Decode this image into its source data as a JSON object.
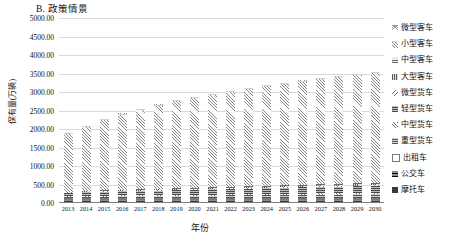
{
  "chart_data": {
    "type": "bar",
    "subtype": "stacked-bar",
    "title": "B. 政策情景",
    "xlabel": "年份",
    "ylabel": "保有量(万辆)",
    "ylim": [
      0,
      5000
    ],
    "ytick_labels": [
      "5000.00",
      "4500.00",
      "4000.00",
      "3500.00",
      "3000.00",
      "2500.00",
      "2000.00",
      "1500.00",
      "1000.00",
      "500.00",
      "0.00"
    ],
    "ytick_values": [
      5000,
      4500,
      4000,
      3500,
      3000,
      2500,
      2000,
      1500,
      1000,
      500,
      0
    ],
    "grid": true,
    "legend_position": "right",
    "categories": [
      "2013",
      "2014",
      "2015",
      "2016",
      "2017",
      "2018",
      "2019",
      "2020",
      "2021",
      "2022",
      "2023",
      "2024",
      "2025",
      "2026",
      "2027",
      "2028",
      "2029",
      "2030"
    ],
    "series": [
      {
        "name": "摩托车",
        "pattern": "p-moto",
        "values": [
          60,
          60,
          60,
          60,
          58,
          58,
          56,
          56,
          54,
          54,
          52,
          52,
          50,
          50,
          48,
          48,
          46,
          46
        ]
      },
      {
        "name": "公交车",
        "pattern": "p-bus",
        "values": [
          12,
          13,
          14,
          15,
          16,
          17,
          18,
          19,
          20,
          21,
          22,
          23,
          24,
          25,
          26,
          27,
          28,
          29
        ]
      },
      {
        "name": "出租车",
        "pattern": "p-taxi",
        "values": [
          8,
          8,
          9,
          9,
          10,
          10,
          11,
          11,
          12,
          12,
          13,
          13,
          14,
          14,
          15,
          15,
          16,
          16
        ]
      },
      {
        "name": "重型货车",
        "pattern": "p-heavy",
        "values": [
          40,
          44,
          48,
          52,
          56,
          60,
          64,
          68,
          72,
          76,
          80,
          84,
          88,
          92,
          96,
          100,
          104,
          108
        ]
      },
      {
        "name": "中型货车",
        "pattern": "p-medium",
        "values": [
          22,
          23,
          24,
          25,
          26,
          27,
          28,
          29,
          30,
          31,
          32,
          33,
          34,
          35,
          36,
          37,
          38,
          39
        ]
      },
      {
        "name": "轻型货车",
        "pattern": "p-light",
        "values": [
          90,
          96,
          102,
          108,
          114,
          120,
          126,
          132,
          138,
          144,
          150,
          156,
          162,
          168,
          174,
          180,
          186,
          192
        ]
      },
      {
        "name": "微型货车",
        "pattern": "p-mini-truck",
        "values": [
          10,
          10,
          11,
          11,
          12,
          12,
          13,
          13,
          14,
          14,
          15,
          15,
          16,
          16,
          17,
          17,
          18,
          18
        ]
      },
      {
        "name": "大型客车",
        "pattern": "p-large-bus",
        "values": [
          14,
          15,
          16,
          17,
          18,
          19,
          20,
          21,
          22,
          23,
          24,
          25,
          26,
          27,
          28,
          29,
          30,
          31
        ]
      },
      {
        "name": "中型客车",
        "pattern": "p-med-bus",
        "values": [
          10,
          11,
          12,
          13,
          14,
          15,
          16,
          17,
          18,
          19,
          20,
          21,
          22,
          23,
          24,
          25,
          26,
          27
        ]
      },
      {
        "name": "小型客车",
        "pattern": "p-small-bus",
        "values": [
          1580,
          1760,
          1930,
          2060,
          2180,
          2280,
          2380,
          2460,
          2530,
          2600,
          2660,
          2720,
          2770,
          2820,
          2870,
          2910,
          2950,
          2990
        ]
      },
      {
        "name": "微型客车",
        "pattern": "p-mini-bus",
        "values": [
          6,
          6,
          6,
          6,
          6,
          6,
          6,
          6,
          6,
          6,
          6,
          6,
          6,
          6,
          6,
          6,
          6,
          6
        ]
      }
    ],
    "totals": [
      1852,
      2046,
      2232,
      2376,
      2510,
      2618,
      2738,
      2832,
      2916,
      3000,
      3074,
      3148,
      3212,
      3276,
      3340,
      3384,
      3448,
      3502
    ]
  }
}
